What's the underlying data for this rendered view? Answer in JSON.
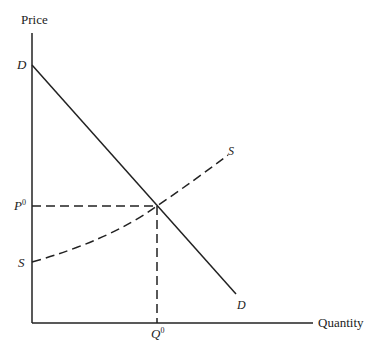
{
  "diagram": {
    "type": "supply-demand",
    "axes": {
      "y_label": "Price",
      "x_label": "Quantity"
    },
    "curves": {
      "demand": {
        "label_start": "D",
        "label_end": "D",
        "style": "solid"
      },
      "supply": {
        "label_start": "S",
        "label_end": "S",
        "style": "dashed"
      }
    },
    "equilibrium": {
      "price_label": "P",
      "price_sup": "0",
      "quantity_label": "Q",
      "quantity_sup": "0"
    },
    "colors": {
      "line": "#222222",
      "background": "#ffffff"
    }
  }
}
